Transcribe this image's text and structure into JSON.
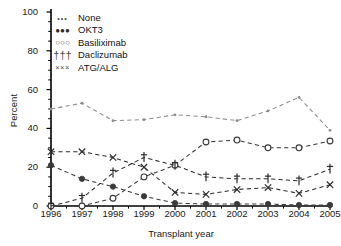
{
  "chart_data": {
    "type": "line",
    "title": "",
    "xlabel": "Transplant year",
    "ylabel": "Percent",
    "categories": [
      1996,
      1997,
      1998,
      1999,
      2000,
      2001,
      2002,
      2003,
      2004,
      2005
    ],
    "xtick_labels": [
      "1996",
      "1997",
      "1998",
      "1999",
      "2000",
      "2001",
      "2002",
      "2003",
      "2004",
      "2005"
    ],
    "ytick_labels": [
      "0",
      "20",
      "40",
      "60",
      "80",
      "100"
    ],
    "ytick_values": [
      0,
      20,
      40,
      60,
      80,
      100
    ],
    "ylim": [
      0,
      100
    ],
    "xlim": [
      1996,
      2005
    ],
    "grid": false,
    "legend_position": "top-left",
    "minor_ticks": true,
    "series": [
      {
        "name": "None",
        "marker": "dot-small",
        "color": "#8c8c8c",
        "linestyle": "dashed",
        "values": [
          50,
          53,
          44,
          44.5,
          47,
          46,
          44,
          49,
          56,
          39
        ]
      },
      {
        "name": "OKT3",
        "marker": "filled-circle",
        "color": "#3a3a3a",
        "linestyle": "dashed",
        "values": [
          21,
          14,
          10,
          5,
          1.5,
          1,
          1,
          1,
          0.5,
          0.5
        ]
      },
      {
        "name": "Basiliximab",
        "marker": "open-circle",
        "color": "#3a3a3a",
        "linestyle": "dashed",
        "values": [
          0,
          0,
          4,
          15,
          21,
          33,
          34,
          30,
          30,
          33.5
        ]
      },
      {
        "name": "Daclizumab",
        "marker": "dagger",
        "color": "#2b2b2b",
        "linestyle": "dashed",
        "values": [
          0,
          4,
          17,
          25,
          21,
          15,
          14,
          14,
          13,
          19
        ]
      },
      {
        "name": "ATG/ALG",
        "marker": "cross-x",
        "color": "#2b2b2b",
        "linestyle": "dashed",
        "values": [
          28,
          28,
          25,
          20,
          7,
          6,
          8.5,
          9.5,
          6.5,
          11
        ]
      }
    ]
  },
  "legend": {
    "items": [
      {
        "key": "•••",
        "label": "None",
        "key_class": "key-none"
      },
      {
        "key": "●●●",
        "label": "OKT3",
        "key_class": "key-okt3"
      },
      {
        "key": "○○○",
        "label": "Basiliximab",
        "key_class": "key-bas"
      },
      {
        "key": "†††",
        "label": "Daclizumab",
        "key_class": "key-dac"
      },
      {
        "key": "×××",
        "label": "ATG/ALG",
        "key_class": "key-atg"
      }
    ]
  }
}
